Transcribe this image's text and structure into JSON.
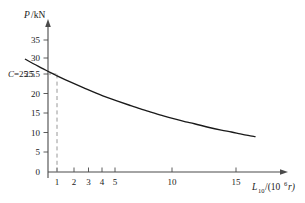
{
  "chart_data": {
    "type": "line",
    "title": "",
    "subtitle": "",
    "xlabel": "L_10/(10^6 r)",
    "xlabel_parts": {
      "symbol": "L",
      "subscript": "10",
      "divider": "/(10",
      "superscript": "6",
      "unit_tail": "r)"
    },
    "ylabel": "P/kN",
    "ylabel_parts": {
      "symbol": "P",
      "unit": "/kN"
    },
    "xscale": "log",
    "yscale": "linear",
    "xlim": [
      0.62,
      20
    ],
    "ylim": [
      0,
      37
    ],
    "grid": false,
    "legend": null,
    "xticks": [
      1,
      2,
      3,
      4,
      5,
      10,
      15
    ],
    "xticklabels": [
      "1",
      "2",
      "3",
      "4",
      "5",
      "10",
      "15"
    ],
    "yticks": [
      0,
      5,
      10,
      15,
      20,
      25.5,
      30,
      35
    ],
    "yticklabels": [
      "0",
      "5",
      "10",
      "15",
      "20",
      "25.5",
      "30",
      "35"
    ],
    "series": [
      {
        "name": "Basic rating life curve P = C / L^(1/3)",
        "equation": "P = 25.5 * L^(-1/3)",
        "x": [
          0.62,
          0.7,
          0.8,
          0.9,
          1.0,
          1.2,
          1.5,
          2.0,
          2.5,
          3.0,
          3.5,
          4.0,
          5.0,
          6.0,
          7.0,
          8.0,
          10.0,
          12.0,
          14.0,
          16.0,
          18.0,
          20.0
        ],
        "y": [
          29.9,
          28.7,
          27.5,
          26.4,
          25.5,
          24.0,
          22.3,
          20.2,
          18.8,
          17.7,
          16.8,
          16.1,
          14.9,
          14.0,
          13.3,
          12.8,
          11.8,
          11.1,
          10.6,
          10.1,
          9.7,
          9.4
        ]
      }
    ],
    "annotations": [
      {
        "name": "rated-dynamic-load",
        "label": "C=25.5",
        "label_symbol": "C",
        "label_value": "=25.5",
        "x": 1,
        "y": 25.5,
        "guide": "dashed vertical line from x-axis up to curve at L10 = 1, plus dashed horizontal to y-axis"
      }
    ],
    "colors": {
      "curve": "#1a1a1a",
      "axis": "#4a4a4a",
      "guide": "#8c8c8c",
      "text": "#1a1a1a",
      "background": "#ffffff"
    }
  }
}
